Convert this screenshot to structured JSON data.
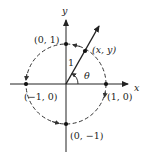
{
  "diagram": {
    "axes": {
      "x_label": "x",
      "y_label": "y"
    },
    "points": [
      {
        "label": "(0, 1)",
        "x": 0,
        "y": 1
      },
      {
        "label": "(x, y)",
        "x": 0.48,
        "y": 0.88
      },
      {
        "label": "(−1, 0)",
        "x": -1,
        "y": 0
      },
      {
        "label": "(1, 0)",
        "x": 1,
        "y": 0
      },
      {
        "label": "(0, −1)",
        "x": 0,
        "y": -1
      }
    ],
    "ray": {
      "length_label": "1",
      "angle_label": "θ",
      "angle_deg": 61
    },
    "circle": {
      "radius": 1,
      "style": "dashed",
      "direction": "counterclockwise"
    },
    "colors": {
      "stroke": "#222222",
      "background": "#ffffff"
    }
  }
}
